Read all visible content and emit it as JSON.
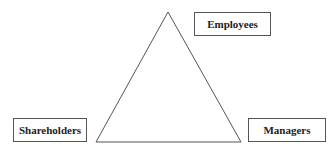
{
  "diagram": {
    "type": "triangle-stakeholders",
    "nodes": [
      {
        "id": "employees",
        "label": "Employees",
        "position": "top"
      },
      {
        "id": "shareholders",
        "label": "Shareholders",
        "position": "bottom-left"
      },
      {
        "id": "managers",
        "label": "Managers",
        "position": "bottom-right"
      }
    ],
    "colors": {
      "line": "#555555",
      "text": "#222222",
      "background": "#ffffff"
    }
  }
}
